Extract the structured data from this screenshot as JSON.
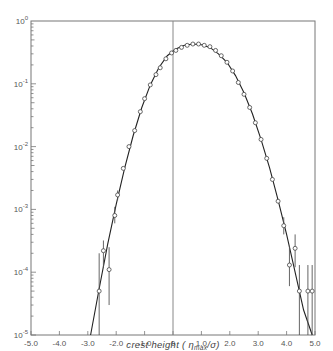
{
  "chart_data": {
    "type": "scatter",
    "title": "",
    "xlabel": "crest height ( η_max/σ )",
    "xlabel_main": "crest height (",
    "xlabel_sym": "η",
    "xlabel_sub": "max",
    "xlabel_tail": "/σ)",
    "ylabel": "",
    "yscale": "log",
    "xlim": [
      -5.0,
      5.0
    ],
    "ylim": [
      1e-05,
      1
    ],
    "x_ticks": [
      "-5.0",
      "-4.0",
      "-3.0",
      "-2.0",
      "-1.0",
      "0",
      "1.0",
      "2.0",
      "3.0",
      "4.0",
      "5.0"
    ],
    "x_tick_values": [
      -5,
      -4,
      -3,
      -2,
      -1,
      0,
      1,
      2,
      3,
      4,
      5
    ],
    "y_ticks": [
      {
        "base": "10",
        "exp": "0",
        "value": 0
      },
      {
        "base": "10",
        "exp": "-1",
        "value": -1
      },
      {
        "base": "10",
        "exp": "-2",
        "value": -2
      },
      {
        "base": "10",
        "exp": "-3",
        "value": -3
      },
      {
        "base": "10",
        "exp": "-4",
        "value": -4
      },
      {
        "base": "10",
        "exp": "-5",
        "value": -5
      }
    ],
    "grid": false,
    "legend": null,
    "reference_line_x": 0,
    "series": [
      {
        "name": "measured",
        "marker": "open-circle",
        "points": [
          {
            "x": -2.6,
            "y": 5e-05,
            "err": [
              1e-05,
              0.0002
            ]
          },
          {
            "x": -2.45,
            "y": 0.00022,
            "err": [
              0.00012,
              0.00032
            ]
          },
          {
            "x": -2.25,
            "y": 0.00011,
            "err": [
              3e-05,
              0.00025
            ]
          },
          {
            "x": -2.05,
            "y": 0.0008,
            "err": [
              0.0006,
              0.0011
            ]
          },
          {
            "x": -1.95,
            "y": 0.0017,
            "err": [
              0.0014,
              0.002
            ]
          },
          {
            "x": -1.75,
            "y": 0.0045
          },
          {
            "x": -1.55,
            "y": 0.01
          },
          {
            "x": -1.35,
            "y": 0.018
          },
          {
            "x": -1.15,
            "y": 0.036
          },
          {
            "x": -1.0,
            "y": 0.058
          },
          {
            "x": -0.8,
            "y": 0.096
          },
          {
            "x": -0.6,
            "y": 0.14
          },
          {
            "x": -0.45,
            "y": 0.18
          },
          {
            "x": -0.25,
            "y": 0.25
          },
          {
            "x": -0.05,
            "y": 0.31
          },
          {
            "x": 0.1,
            "y": 0.34
          },
          {
            "x": 0.3,
            "y": 0.38
          },
          {
            "x": 0.5,
            "y": 0.41
          },
          {
            "x": 0.7,
            "y": 0.43
          },
          {
            "x": 0.9,
            "y": 0.43
          },
          {
            "x": 1.1,
            "y": 0.41
          },
          {
            "x": 1.3,
            "y": 0.39
          },
          {
            "x": 1.5,
            "y": 0.34
          },
          {
            "x": 1.7,
            "y": 0.28
          },
          {
            "x": 1.9,
            "y": 0.22
          },
          {
            "x": 2.1,
            "y": 0.16
          },
          {
            "x": 2.3,
            "y": 0.105
          },
          {
            "x": 2.5,
            "y": 0.068
          },
          {
            "x": 2.7,
            "y": 0.042
          },
          {
            "x": 2.9,
            "y": 0.024
          },
          {
            "x": 3.1,
            "y": 0.013
          },
          {
            "x": 3.3,
            "y": 0.0065
          },
          {
            "x": 3.5,
            "y": 0.003
          },
          {
            "x": 3.7,
            "y": 0.00135
          },
          {
            "x": 3.9,
            "y": 0.00055,
            "err": [
              0.0004,
              0.00075
            ]
          },
          {
            "x": 4.1,
            "y": 0.00013,
            "err": [
              6e-05,
              0.00026
            ]
          },
          {
            "x": 4.3,
            "y": 0.00024,
            "err": [
              0.00012,
              0.0004
            ]
          },
          {
            "x": 4.45,
            "y": 5e-05,
            "err": [
              1e-05,
              0.00013
            ]
          },
          {
            "x": 4.75,
            "y": 5e-05,
            "err": [
              1e-05,
              0.00013
            ]
          },
          {
            "x": 4.9,
            "y": 5e-05,
            "err": [
              1e-05,
              0.00013
            ]
          }
        ]
      },
      {
        "name": "theoretical curve",
        "type": "line",
        "x": [
          -2.9,
          -2.6,
          -2.3,
          -2.0,
          -1.7,
          -1.4,
          -1.1,
          -0.8,
          -0.5,
          -0.2,
          0.1,
          0.4,
          0.7,
          1.0,
          1.3,
          1.6,
          1.9,
          2.2,
          2.5,
          2.8,
          3.1,
          3.4,
          3.7,
          4.0,
          4.3,
          4.6,
          4.9
        ],
        "y": [
          1e-05,
          5.5e-05,
          0.00028,
          0.0012,
          0.0046,
          0.015,
          0.042,
          0.096,
          0.18,
          0.28,
          0.36,
          0.41,
          0.43,
          0.42,
          0.38,
          0.3,
          0.22,
          0.135,
          0.072,
          0.033,
          0.013,
          0.0046,
          0.0014,
          0.0004,
          0.0001,
          2.5e-05,
          1e-05
        ]
      }
    ]
  }
}
